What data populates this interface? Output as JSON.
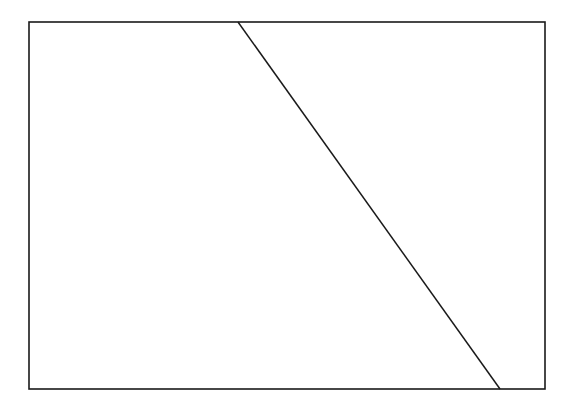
{
  "document": {
    "title": "Geometric Figure",
    "background_color": "#ffffff",
    "width": 581,
    "height": 415
  },
  "figure": {
    "name": "rectangle-with-diagonal-transversal",
    "stroke_color": "#1a1a1a",
    "fill_color": "#ffffff",
    "rectangle": {
      "name": "outer-rectangle",
      "x": 29,
      "y": 22,
      "width": 516,
      "height": 367,
      "stroke_width": 1.6,
      "corners": {
        "top_left": [
          29,
          22
        ],
        "top_right": [
          545,
          22
        ],
        "bottom_right": [
          545,
          389
        ],
        "bottom_left": [
          29,
          389
        ]
      }
    },
    "diagonal": {
      "name": "diagonal-line",
      "x1": 238,
      "y1": 22,
      "x2": 500,
      "y2": 389,
      "stroke_width": 1.5,
      "top_edge_intersection_x": 238,
      "bottom_edge_intersection_x": 500
    },
    "regions": [
      {
        "name": "left-quadrilateral",
        "vertices": [
          [
            29,
            22
          ],
          [
            238,
            22
          ],
          [
            500,
            389
          ],
          [
            29,
            389
          ]
        ]
      },
      {
        "name": "right-triangle",
        "vertices": [
          [
            238,
            22
          ],
          [
            545,
            22
          ],
          [
            545,
            389
          ],
          [
            500,
            389
          ]
        ]
      }
    ]
  }
}
